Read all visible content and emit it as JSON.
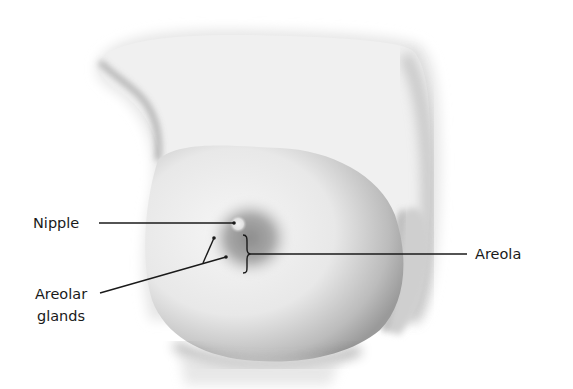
{
  "figure": {
    "colors": {
      "background": "#ffffff",
      "skin_light": "#f4f4f4",
      "skin_shadow": "#8a8a8a",
      "areola": "#9a9a9a",
      "leader_line": "#1a1a1a",
      "label_text": "#1a1a1a"
    }
  },
  "labels": {
    "nipple": "Nipple",
    "areolar_glands": "Areolar\nglands",
    "areola": "Areola"
  }
}
